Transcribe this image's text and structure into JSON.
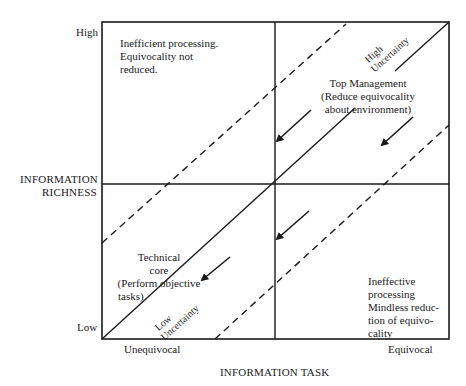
{
  "axes": {
    "y_label_line1": "INFORMATION",
    "y_label_line2": "RICHNESS",
    "y_high": "High",
    "y_low": "Low",
    "x_label": "INFORMATION TASK",
    "x_left": "Unequivocal",
    "x_right": "Equivocal"
  },
  "quadrants": {
    "top_left": [
      "Inefficient processing.",
      "Equivocality not",
      "reduced."
    ],
    "top_right": [
      "Top Management",
      "(Reduce equivocality",
      "about environment)"
    ],
    "bottom_left": [
      "Technical",
      "core",
      "(Perform objective",
      "tasks)"
    ],
    "bottom_right": [
      "Ineffective",
      "processing",
      "Mindless reduc-",
      "tion of equivo-",
      "cality"
    ]
  },
  "diagonal_labels": {
    "high_line1": "High",
    "high_line2": "Uncertainty",
    "low_line1": "Low",
    "low_line2": "Uncertainty"
  },
  "colors": {
    "ink": "#1a1a1a",
    "background": "#ffffff"
  }
}
